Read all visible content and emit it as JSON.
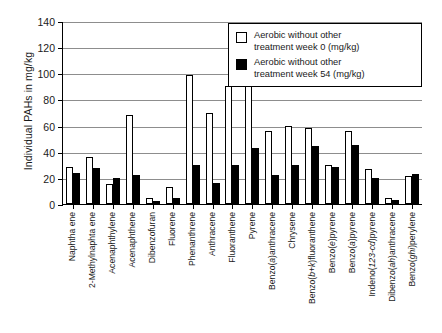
{
  "chart_data": {
    "type": "bar",
    "title": "",
    "xlabel": "",
    "ylabel": "Individual PAHs in mg/kg",
    "ylim": [
      0,
      140
    ],
    "yticks": [
      0,
      20,
      40,
      60,
      80,
      100,
      120,
      140
    ],
    "grid": true,
    "legend_position": "top-right",
    "categories": [
      "Naphtha ene",
      "2-Methylnaphta ene",
      "Acenaphthylene",
      "Acenaphthene",
      "Dibenzofuran",
      "Fluorene",
      "Phenanthrene",
      "Anthracene",
      "Fluoranthene",
      "Pyrene",
      "Benzo(a)anthracene",
      "Chrysene",
      "Benzo(b+k)fluoranthene",
      "Benzo(e)pyrene",
      "Benzo(a)pyrene",
      "Indeno(123-cd)pyrene",
      "Dibenzo(ah)anthracene",
      "Benzo(ghi)perylene"
    ],
    "series": [
      {
        "name": "Aerobic without other treatment week 0 (mg/kg)",
        "color": "#ffffff",
        "edge": "#000000",
        "values": [
          28.5,
          36.0,
          15.5,
          68.0,
          4.5,
          13.0,
          99.0,
          69.5,
          90.0,
          134.0,
          55.5,
          59.5,
          58.0,
          30.0,
          55.5,
          26.5,
          4.5,
          21.5
        ]
      },
      {
        "name": "Aerobic without other treatment week 54 (mg/kg)",
        "color": "#000000",
        "edge": "#000000",
        "values": [
          23.5,
          27.5,
          20.0,
          22.5,
          2.0,
          4.5,
          30.0,
          16.0,
          30.0,
          43.0,
          22.5,
          30.0,
          44.5,
          28.5,
          45.5,
          20.0,
          3.0,
          23.0
        ]
      }
    ]
  },
  "legend": {
    "entries": [
      {
        "swatch": "open-square-swatch",
        "line1": "Aerobic without other",
        "line2": "treatment week 0 (mg/kg)"
      },
      {
        "swatch": "filled-square-swatch",
        "line1": "Aerobic without other",
        "line2": "treatment week 54 (mg/kg)"
      }
    ]
  }
}
